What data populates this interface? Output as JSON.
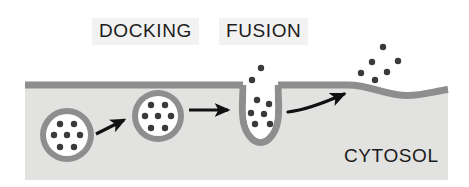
{
  "figure": {
    "width": 469,
    "height": 187,
    "background_color": "#ffffff"
  },
  "labels": {
    "docking": "DOCKING",
    "fusion": "FUSION",
    "cytosol": "CYTOSOL"
  },
  "colors": {
    "cytosol_fill": "#e2e2e0",
    "membrane": "#8e8e8e",
    "vesicle_membrane": "#8e8e8e",
    "vesicle_lumen": "#ffffff",
    "cargo_particle": "#3a3a3a",
    "arrow": "#111111",
    "label_background": "#f2f2f2",
    "label_text": "#1c1c1c"
  },
  "membrane": {
    "name": "plasma-membrane",
    "thickness_px": 7,
    "baseline_y": 85,
    "left_x": 25,
    "right_x": 448,
    "description": "Horizontal gray band with a U-shaped invagination at the fusion site and a shallow dip at the released-cargo site"
  },
  "cytosol_region": {
    "name": "cytosol-fill",
    "left_x": 25,
    "right_x": 448,
    "top_y": 85,
    "bottom_y": 180
  },
  "vesicles": [
    {
      "name": "vesicle-free",
      "stage": "free",
      "cx": 67,
      "cy": 135,
      "outer_r": 27,
      "inner_r": 21,
      "cargo_count": 7,
      "cargo_r": 3.2,
      "cargo": [
        {
          "x": 60,
          "y": 124
        },
        {
          "x": 74,
          "y": 124
        },
        {
          "x": 54,
          "y": 135
        },
        {
          "x": 67,
          "y": 135
        },
        {
          "x": 80,
          "y": 135
        },
        {
          "x": 60,
          "y": 147
        },
        {
          "x": 74,
          "y": 147
        }
      ]
    },
    {
      "name": "vesicle-docked",
      "stage": "docked",
      "cx": 158,
      "cy": 116,
      "outer_r": 26,
      "inner_r": 20,
      "cargo_count": 7,
      "cargo_r": 3.2,
      "cargo": [
        {
          "x": 151,
          "y": 105
        },
        {
          "x": 165,
          "y": 105
        },
        {
          "x": 145,
          "y": 116
        },
        {
          "x": 158,
          "y": 116
        },
        {
          "x": 171,
          "y": 116
        },
        {
          "x": 151,
          "y": 128
        },
        {
          "x": 165,
          "y": 128
        }
      ]
    }
  ],
  "fusion_pore": {
    "name": "fusion-pore",
    "mouth_left_x": 245,
    "mouth_right_x": 275,
    "bottom_y": 130,
    "cargo_r": 3.2,
    "cargo_inside": [
      {
        "x": 257,
        "y": 100
      },
      {
        "x": 269,
        "y": 104
      },
      {
        "x": 251,
        "y": 113
      },
      {
        "x": 264,
        "y": 114
      },
      {
        "x": 255,
        "y": 124
      },
      {
        "x": 270,
        "y": 124
      }
    ],
    "cargo_escaping": [
      {
        "x": 261,
        "y": 68
      },
      {
        "x": 252,
        "y": 80
      }
    ]
  },
  "released_cargo": {
    "name": "released-cargo-cluster",
    "cargo_r": 3.2,
    "particles": [
      {
        "x": 383,
        "y": 47
      },
      {
        "x": 372,
        "y": 62
      },
      {
        "x": 398,
        "y": 61
      },
      {
        "x": 361,
        "y": 73
      },
      {
        "x": 387,
        "y": 72
      },
      {
        "x": 375,
        "y": 80
      }
    ]
  },
  "arrows": [
    {
      "name": "arrow-free-to-docked",
      "type": "straight",
      "from": {
        "x": 96,
        "y": 134
      },
      "to": {
        "x": 126,
        "y": 119
      }
    },
    {
      "name": "arrow-docked-to-fusion",
      "type": "straight",
      "from": {
        "x": 189,
        "y": 110
      },
      "to": {
        "x": 231,
        "y": 110
      }
    },
    {
      "name": "arrow-fusion-to-release",
      "type": "curved",
      "from": {
        "x": 288,
        "y": 112
      },
      "to": {
        "x": 349,
        "y": 92
      }
    }
  ]
}
